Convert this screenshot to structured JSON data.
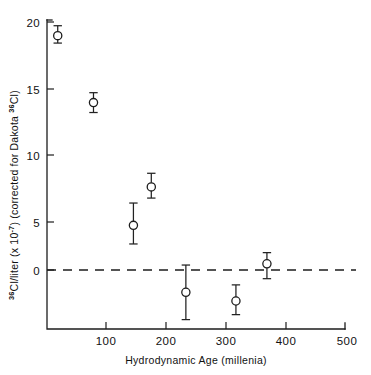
{
  "figure": {
    "background_color": "#ffffff",
    "ink_color": "#1d1d1d",
    "marker_fill": "#ffffff"
  },
  "axes": {
    "y_title_parts": {
      "sup1": "36",
      "mid1": "Cl/liter (x 10",
      "sup2": "-7",
      "mid2": ") (corrected for Dakota ",
      "sup3": "36",
      "mid3": "Cl)"
    },
    "y_title_plain": "36Cl/liter (x 10-7) (corrected for Dakota 36Cl)",
    "x_title": "Hydrodynamic  Age   (millenia)",
    "y_ticks": [
      "0",
      "5",
      "10",
      "15",
      "20"
    ],
    "x_ticks": [
      "100",
      "200",
      "300",
      "400",
      "500"
    ]
  },
  "chart_data": {
    "type": "scatter",
    "title": "",
    "xlabel": "Hydrodynamic Age (millenia)",
    "ylabel": "36Cl/liter (x 10^-7) (corrected for Dakota 36Cl)",
    "xlim": [
      0,
      500
    ],
    "ylim": [
      -4.3,
      20.5
    ],
    "xticks": [
      100,
      200,
      300,
      400,
      500
    ],
    "yticks": [
      0,
      5,
      10,
      15,
      20
    ],
    "grid": false,
    "legend": "none",
    "reference_lines": [
      {
        "name": "zero-line",
        "orientation": "horizontal",
        "y": 0,
        "style": "dashed"
      }
    ],
    "series": [
      {
        "name": "36Cl corrected",
        "marker": "open-circle",
        "error_bars": "y",
        "points": [
          {
            "x": 18,
            "y": 18.9,
            "yerr_low": 0.6,
            "yerr_high": 0.8
          },
          {
            "x": 78,
            "y": 13.5,
            "yerr_low": 0.8,
            "yerr_high": 0.8
          },
          {
            "x": 145,
            "y": 3.6,
            "yerr_low": 1.5,
            "yerr_high": 1.8
          },
          {
            "x": 175,
            "y": 6.7,
            "yerr_low": 0.9,
            "yerr_high": 1.1
          },
          {
            "x": 233,
            "y": -1.8,
            "yerr_low": 2.2,
            "yerr_high": 2.2
          },
          {
            "x": 317,
            "y": -2.5,
            "yerr_low": 1.1,
            "yerr_high": 1.3
          },
          {
            "x": 369,
            "y": 0.5,
            "yerr_low": 1.2,
            "yerr_high": 0.9
          }
        ]
      }
    ]
  }
}
